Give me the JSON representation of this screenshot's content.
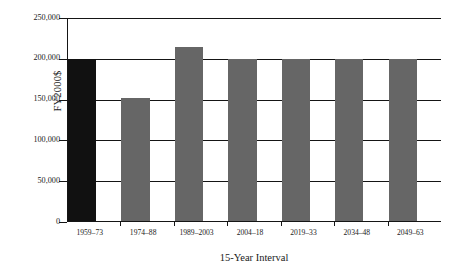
{
  "chart_data": {
    "type": "bar",
    "title": "",
    "xlabel": "15-Year Interval",
    "ylabel": "FY2000$",
    "categories": [
      "1959–73",
      "1974–88",
      "1989–2003",
      "2004–18",
      "2019–33",
      "2034–48",
      "2049–63"
    ],
    "values": [
      200000,
      152000,
      215000,
      200000,
      200000,
      200000,
      200000
    ],
    "ylim": [
      0,
      250000
    ],
    "ytick_values": [
      0,
      50000,
      100000,
      150000,
      200000,
      250000
    ],
    "ytick_labels": [
      "0",
      "50,000",
      "100,000",
      "150,000",
      "200,000",
      "250,000"
    ],
    "grid": true,
    "legend": "none",
    "bar_colors": [
      "#111111",
      "#666666",
      "#666666",
      "#666666",
      "#666666",
      "#666666",
      "#666666"
    ],
    "series": [
      {
        "name": "FY2000$",
        "values": [
          200000,
          152000,
          215000,
          200000,
          200000,
          200000,
          200000
        ]
      }
    ]
  },
  "colors": {
    "axis": "#151515",
    "grid": "#151515",
    "bar_primary": "#666666",
    "bar_highlight": "#111111",
    "background": "#ffffff",
    "text": "#1a1a1a"
  }
}
